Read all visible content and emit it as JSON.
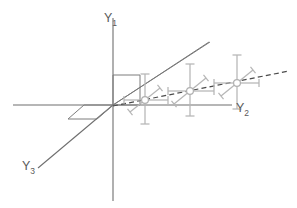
{
  "figure": {
    "background_color": "#ffffff",
    "width": 297,
    "height": 208,
    "axis_color": "#6f6f6f",
    "whisker_color": "#b6b6b6",
    "trend_color": "#4a4a4a",
    "label_color": "#5a5a5a"
  },
  "axes": [
    {
      "id": "y1",
      "name": "vertical-axis",
      "base": "Y",
      "subscript": "1",
      "orientation": "vertical",
      "x1": 113,
      "y1": 18,
      "x2": 113,
      "y2": 201,
      "label_x": 104,
      "label_y": 22
    },
    {
      "id": "y2",
      "name": "horizontal-axis",
      "base": "Y",
      "subscript": "2",
      "orientation": "horizontal",
      "x1": 13,
      "y1": 105,
      "x2": 232,
      "y2": 105,
      "label_x": 236,
      "label_y": 112
    },
    {
      "id": "y3",
      "name": "depth-axis",
      "base": "Y",
      "subscript": "3",
      "orientation": "diagonal",
      "x1": 113,
      "y1": 105,
      "x2": 38,
      "y2": 168,
      "label_x": 22,
      "label_y": 170
    }
  ],
  "rays": [
    {
      "name": "solid-diagonal-ray",
      "style": "solid",
      "x1": 113,
      "y1": 105,
      "x2": 209,
      "y2": 42
    },
    {
      "name": "upper-depth-ray",
      "style": "solid",
      "x1": 113,
      "y1": 105,
      "x2": 210,
      "y2": 42
    }
  ],
  "trend_line": {
    "name": "dashed-trend-line",
    "style": "dashed",
    "x1": 113,
    "y1": 106,
    "x2": 289,
    "y2": 71,
    "dash_pattern": "5 3.2"
  },
  "shapes": [
    {
      "name": "origin-rectangle",
      "type": "rectangle",
      "points": "113,75 140,75 140,105 113,105"
    },
    {
      "name": "depth-parallelogram",
      "type": "parallelogram",
      "points": "113,105 84,105 68,119 97,119"
    }
  ],
  "chart_data": {
    "type": "scatter",
    "xlabel": "Y2",
    "ylabel": "Y1",
    "zlabel": "Y3",
    "grid": false,
    "legend": false,
    "note": "Three data points plotted along a dashed trend line, each with multi-directional error whiskers in three axis directions.",
    "points": [
      {
        "id": "p1",
        "label": "point-1",
        "x_px": 145,
        "y_px": 100,
        "marker_radius": 3.4,
        "whiskers": [
          {
            "dir": "up",
            "dx": 0,
            "dy": -26,
            "cap": "horizontal",
            "cap_len": 9
          },
          {
            "dir": "down",
            "dx": 0,
            "dy": 24,
            "cap": "horizontal",
            "cap_len": 9
          },
          {
            "dir": "right",
            "dx": 23,
            "dy": 0,
            "cap": "vertical",
            "cap_len": 8
          },
          {
            "dir": "left",
            "dx": -21,
            "dy": 0,
            "cap": "vertical",
            "cap_len": 8
          },
          {
            "dir": "up-right",
            "dx": 15,
            "dy": -12,
            "cap": "diagonal",
            "cap_len": 8
          },
          {
            "dir": "down-left",
            "dx": -15,
            "dy": 12,
            "cap": "diagonal",
            "cap_len": 8
          }
        ]
      },
      {
        "id": "p2",
        "label": "point-2",
        "x_px": 190,
        "y_px": 91,
        "marker_radius": 3.4,
        "whiskers": [
          {
            "dir": "up",
            "dx": 0,
            "dy": -27,
            "cap": "horizontal",
            "cap_len": 9
          },
          {
            "dir": "down",
            "dx": 0,
            "dy": 25,
            "cap": "horizontal",
            "cap_len": 9
          },
          {
            "dir": "right",
            "dx": 24,
            "dy": 0,
            "cap": "vertical",
            "cap_len": 8
          },
          {
            "dir": "left",
            "dx": -22,
            "dy": 0,
            "cap": "vertical",
            "cap_len": 8
          },
          {
            "dir": "up-right",
            "dx": 16,
            "dy": -13,
            "cap": "diagonal",
            "cap_len": 8
          },
          {
            "dir": "down-left",
            "dx": -16,
            "dy": 13,
            "cap": "diagonal",
            "cap_len": 8
          }
        ]
      },
      {
        "id": "p3",
        "label": "point-3",
        "x_px": 237,
        "y_px": 83,
        "marker_radius": 3.4,
        "whiskers": [
          {
            "dir": "up",
            "dx": 0,
            "dy": -28,
            "cap": "horizontal",
            "cap_len": 9
          },
          {
            "dir": "down",
            "dx": 0,
            "dy": 26,
            "cap": "horizontal",
            "cap_len": 9
          },
          {
            "dir": "right",
            "dx": 22,
            "dy": 0,
            "cap": "vertical",
            "cap_len": 8
          },
          {
            "dir": "left",
            "dx": -23,
            "dy": 0,
            "cap": "vertical",
            "cap_len": 8
          },
          {
            "dir": "up-right",
            "dx": 16,
            "dy": -13,
            "cap": "diagonal",
            "cap_len": 8
          },
          {
            "dir": "down-left",
            "dx": -16,
            "dy": 13,
            "cap": "diagonal",
            "cap_len": 8
          }
        ]
      }
    ]
  }
}
